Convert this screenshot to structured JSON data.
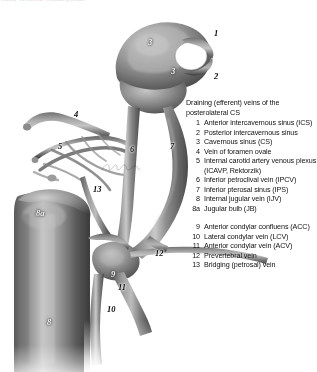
{
  "figure": {
    "alt_name": "posterolateral-cavernous-sinus-venous-drainage",
    "style": "grayscale-airbrush-anatomical-illustration",
    "background_color": "#ffffff",
    "signature_present": true
  },
  "top_strip": {
    "clipped_text": "veins, vertebral venous plexus"
  },
  "legend": {
    "title": "Draining (efferent) veins of the posterolateral CS",
    "items": [
      {
        "num": "1",
        "text": "Anterior intercavernous sinus (ICS)"
      },
      {
        "num": "2",
        "text": "Posterior intercavernous sinus"
      },
      {
        "num": "3",
        "text": "Cavernous sinus (CS)"
      },
      {
        "num": "4",
        "text": "Vein of foramen ovale"
      },
      {
        "num": "5",
        "text": "Internal carotid artery venous plexus (ICAVP, Rektorzik)"
      },
      {
        "num": "6",
        "text": "Inferior petroclival vein (IPCV)"
      },
      {
        "num": "7",
        "text": "Inferior pterosal sinus (IPS)"
      },
      {
        "num": "8",
        "text": "Internal jugular vein (IJV)"
      },
      {
        "num": "8a",
        "text": "Jugular bulb (JB)"
      },
      {
        "num": "",
        "text": ""
      },
      {
        "num": "9",
        "text": "Anterior condylar confluens (ACC)"
      },
      {
        "num": "10",
        "text": "Lateral condylar vein (LCV)"
      },
      {
        "num": "11",
        "text": "Anterior condylar vein (ACV)"
      },
      {
        "num": "12",
        "text": "Prevertebral vein"
      },
      {
        "num": "13",
        "text": "Bridging (petrosal) vein"
      }
    ]
  },
  "callouts": [
    {
      "label": "3",
      "x": 148,
      "y": 38,
      "tone": "light"
    },
    {
      "label": "1",
      "x": 214,
      "y": 29,
      "tone": "dark"
    },
    {
      "label": "3",
      "x": 171,
      "y": 67,
      "tone": "light"
    },
    {
      "label": "2",
      "x": 214,
      "y": 72,
      "tone": "dark"
    },
    {
      "label": "4",
      "x": 74,
      "y": 110,
      "tone": "dark"
    },
    {
      "label": "5",
      "x": 58,
      "y": 142,
      "tone": "dark"
    },
    {
      "label": "6",
      "x": 130,
      "y": 145,
      "tone": "dark"
    },
    {
      "label": "7",
      "x": 170,
      "y": 142,
      "tone": "dark"
    },
    {
      "label": "13",
      "x": 93,
      "y": 185,
      "tone": "dark"
    },
    {
      "label": "8a",
      "x": 36,
      "y": 209,
      "tone": "light"
    },
    {
      "label": "9",
      "x": 111,
      "y": 270,
      "tone": "light"
    },
    {
      "label": "12",
      "x": 155,
      "y": 249,
      "tone": "dark"
    },
    {
      "label": "11",
      "x": 118,
      "y": 283,
      "tone": "dark"
    },
    {
      "label": "10",
      "x": 107,
      "y": 305,
      "tone": "dark"
    },
    {
      "label": "8",
      "x": 47,
      "y": 318,
      "tone": "light"
    }
  ]
}
